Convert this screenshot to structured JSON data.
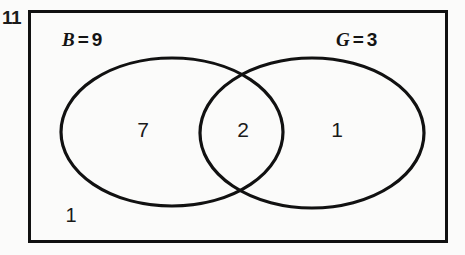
{
  "figure": {
    "number": "11"
  },
  "diagram": {
    "type": "venn-two-set",
    "universal_set": {
      "shape": "rectangle",
      "outside_count": "1"
    },
    "sets": [
      {
        "key": "B",
        "label_variable": "B",
        "label_equals": "=",
        "label_total": "9",
        "exclusive_count": "7",
        "position": "left"
      },
      {
        "key": "G",
        "label_variable": "G",
        "label_equals": "=",
        "label_total": "3",
        "exclusive_count": "1",
        "position": "right"
      }
    ],
    "intersection_count": "2"
  },
  "colors": {
    "stroke": "#111111",
    "text": "#1a1a1a",
    "background": "#fbfbfa"
  }
}
